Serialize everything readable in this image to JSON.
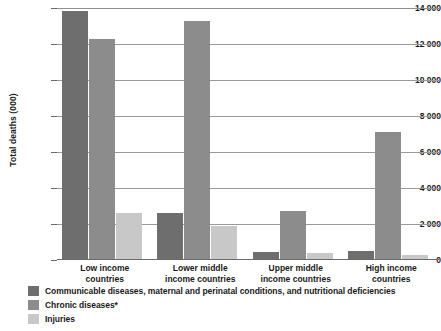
{
  "chart_data": {
    "type": "bar",
    "title": "",
    "xlabel": "",
    "ylabel": "Total deaths (000)",
    "ylim": [
      0,
      14000
    ],
    "ytick_labels": [
      "0",
      "2 000",
      "4 000",
      "6 000",
      "8 000",
      "10 000",
      "12 000",
      "14 000"
    ],
    "ytick_values": [
      0,
      2000,
      4000,
      6000,
      8000,
      10000,
      12000,
      14000
    ],
    "grid": true,
    "legend_position": "bottom-left",
    "categories": [
      "Low income countries",
      "Lower middle income countries",
      "Upper middle income countries",
      "High income countries"
    ],
    "category_lines": [
      [
        "Low income",
        "countries"
      ],
      [
        "Lower middle",
        "income countries"
      ],
      [
        "Upper middle",
        "income countries"
      ],
      [
        "High income",
        "countries"
      ]
    ],
    "series": [
      {
        "name": "Communicable diseases, maternal and perinatal conditions, and nutritional deficiencies",
        "color": "#6e6e6e",
        "values": [
          13850,
          2600,
          450,
          500
        ]
      },
      {
        "name": "Chronic diseases*",
        "color": "#8c8c8c",
        "values": [
          12300,
          13300,
          2700,
          7100
        ]
      },
      {
        "name": "Injuries",
        "color": "#c8c8c8",
        "values": [
          2600,
          1900,
          400,
          300
        ]
      }
    ]
  },
  "colors": {
    "series_1": "#6e6e6e",
    "series_2": "#8c8c8c",
    "series_3": "#c8c8c8",
    "gridline": "#9a9a9a",
    "axis": "#6a6a6a",
    "text": "#1a1a1a",
    "background": "#ffffff"
  }
}
